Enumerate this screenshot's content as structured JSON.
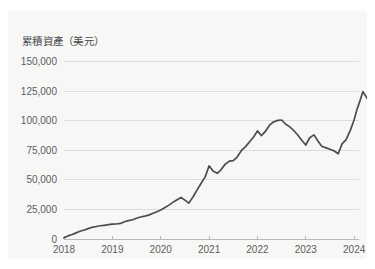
{
  "card": {
    "background_color": "#f7f7f6",
    "page_background_color": "#ffffff"
  },
  "chart_data": {
    "type": "line",
    "title": "累積資產（美元）",
    "xlabel": "",
    "ylabel": "",
    "line_color": "#4a4c4e",
    "grid": true,
    "legend": false,
    "xlim": [
      2018,
      2024.1
    ],
    "ylim": [
      0,
      155000
    ],
    "ytick_labels": [
      "0",
      "25,000",
      "50,000",
      "75,000",
      "100,000",
      "125,000",
      "150,000"
    ],
    "ytick_values": [
      0,
      25000,
      50000,
      75000,
      100000,
      125000,
      150000
    ],
    "xtick_labels": [
      "2018",
      "2019",
      "2020",
      "2021",
      "2022",
      "2023",
      "2024"
    ],
    "xtick_values": [
      2018,
      2019,
      2020,
      2021,
      2022,
      2023,
      2024
    ],
    "series_name": "累積資產",
    "x": [
      2018.0,
      2018.08,
      2018.17,
      2018.25,
      2018.33,
      2018.42,
      2018.5,
      2018.58,
      2018.67,
      2018.75,
      2018.83,
      2018.92,
      2019.0,
      2019.08,
      2019.17,
      2019.25,
      2019.33,
      2019.42,
      2019.5,
      2019.58,
      2019.67,
      2019.75,
      2019.83,
      2019.92,
      2020.0,
      2020.08,
      2020.17,
      2020.25,
      2020.33,
      2020.42,
      2020.5,
      2020.58,
      2020.67,
      2020.75,
      2020.83,
      2020.92,
      2021.0,
      2021.08,
      2021.17,
      2021.25,
      2021.33,
      2021.42,
      2021.5,
      2021.58,
      2021.67,
      2021.75,
      2021.83,
      2021.92,
      2022.0,
      2022.08,
      2022.17,
      2022.25,
      2022.33,
      2022.42,
      2022.5,
      2022.58,
      2022.67,
      2022.75,
      2022.83,
      2022.92,
      2023.0,
      2023.08,
      2023.17,
      2023.25,
      2023.33,
      2023.42,
      2023.5,
      2023.58,
      2023.67,
      2023.75,
      2023.83,
      2023.92,
      2024.0,
      2024.06
    ],
    "values": [
      1000,
      2600,
      3800,
      5200,
      6600,
      7600,
      8800,
      9900,
      10600,
      11200,
      11600,
      12100,
      12600,
      12700,
      13200,
      14600,
      15600,
      16300,
      17600,
      18600,
      19400,
      20200,
      21600,
      23100,
      24600,
      26400,
      28700,
      31000,
      33100,
      35200,
      32900,
      30400,
      35800,
      41400,
      46800,
      52600,
      62000,
      57500,
      55600,
      58800,
      63200,
      66000,
      66400,
      69400,
      75000,
      78000,
      82000,
      86400,
      91600,
      87600,
      91400,
      96400,
      99100,
      100500,
      100800,
      97400,
      95000,
      91900,
      88300,
      83400,
      79600,
      85800,
      88200,
      83000,
      78600,
      77200,
      76000,
      74800,
      72200,
      80600,
      84000,
      92000,
      101000,
      110000
    ],
    "values_tail": [
      {
        "x": 2024.12,
        "y": 117000
      },
      {
        "x": 2024.18,
        "y": 124800
      },
      {
        "x": 2024.24,
        "y": 121200
      },
      {
        "x": 2024.3,
        "y": 116600
      },
      {
        "x": 2024.36,
        "y": 126400
      },
      {
        "x": 2024.42,
        "y": 133800
      },
      {
        "x": 2024.48,
        "y": 137600
      }
    ]
  }
}
